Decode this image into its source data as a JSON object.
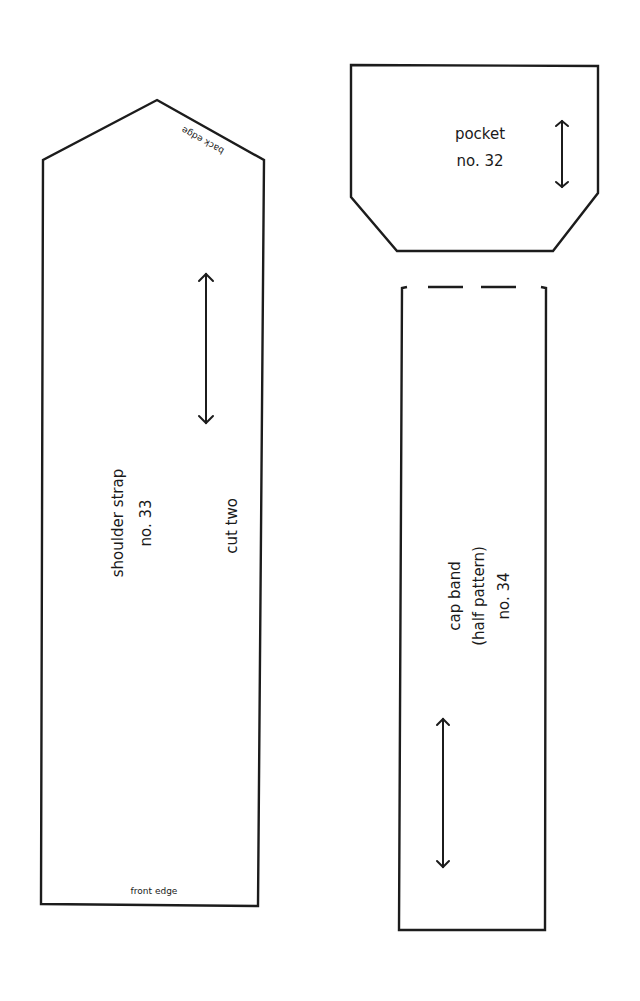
{
  "pieces": {
    "shoulder_strap": {
      "name": "shoulder strap",
      "number": "no. 33",
      "instruction": "cut two",
      "top_edge_label": "back edge",
      "bottom_edge_label": "front edge",
      "grainline": "double-arrow-icon"
    },
    "pocket": {
      "name": "pocket",
      "number": "no. 32",
      "grainline": "double-arrow-icon"
    },
    "cap_band": {
      "name": "cap band",
      "note": "(half pattern)",
      "number": "no. 34",
      "fold_line": "dashed-top-edge",
      "grainline": "double-arrow-icon"
    }
  },
  "colors": {
    "line": "#1c1c1c",
    "background": "#ffffff"
  }
}
